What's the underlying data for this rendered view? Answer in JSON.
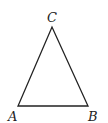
{
  "diagram": {
    "type": "triangle",
    "colors": {
      "stroke": "#222222",
      "background": "#ffffff"
    },
    "vertices": [
      {
        "id": "A",
        "label": "A",
        "x": 18,
        "y": 106,
        "label_x": 8,
        "label_y": 121
      },
      {
        "id": "B",
        "label": "B",
        "x": 88,
        "y": 106,
        "label_x": 88,
        "label_y": 121
      },
      {
        "id": "C",
        "label": "C",
        "x": 52,
        "y": 27,
        "label_x": 47,
        "label_y": 22
      }
    ],
    "edges": [
      [
        "A",
        "B"
      ],
      [
        "B",
        "C"
      ],
      [
        "C",
        "A"
      ]
    ]
  }
}
